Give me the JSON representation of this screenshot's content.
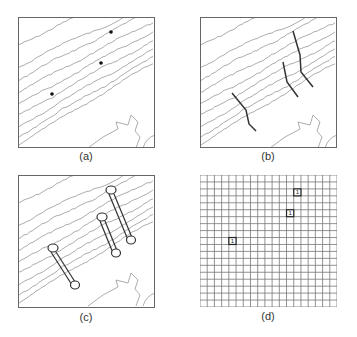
{
  "figure": {
    "panels": [
      {
        "id": "a",
        "caption": "(a)",
        "content": "contour-map-with-seed-points",
        "seed_points": 3
      },
      {
        "id": "b",
        "caption": "(b)",
        "content": "contour-map-with-cross-contour-strokes",
        "strokes": 3
      },
      {
        "id": "c",
        "caption": "(c)",
        "content": "contour-map-with-outlined-bone-shaped-regions",
        "regions": 3
      },
      {
        "id": "d",
        "caption": "(d)",
        "content": "grid-with-labeled-cells",
        "grid_cols": 19,
        "grid_rows": 19,
        "cell_label": "1",
        "labeled_cells": 3
      }
    ]
  },
  "colors": {
    "contour": "#8a8a8a",
    "border": "#666666",
    "stroke": "#333333",
    "grid": "#777777",
    "point": "#111111"
  }
}
